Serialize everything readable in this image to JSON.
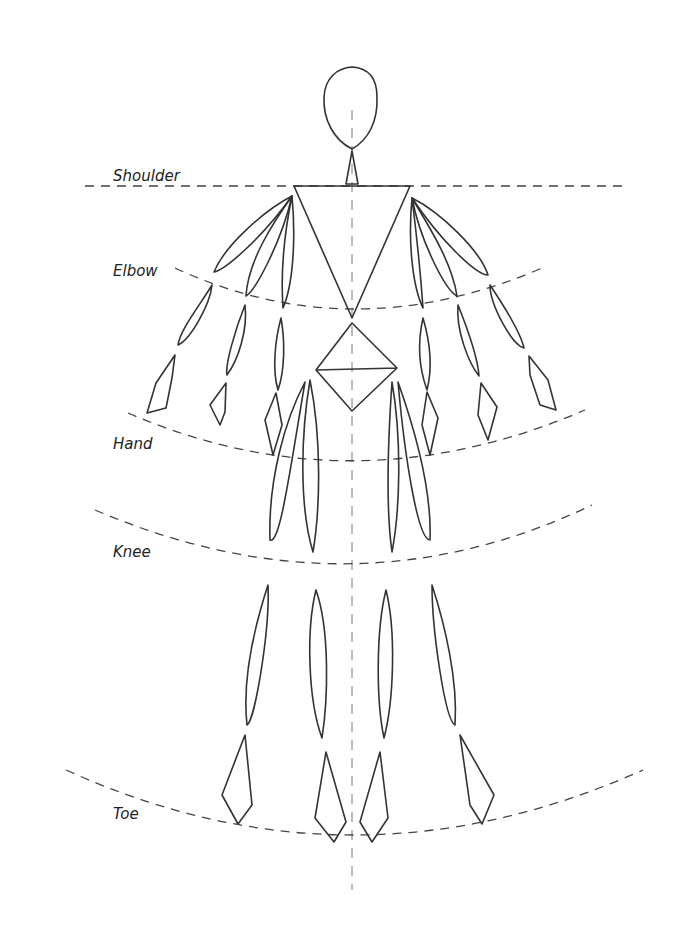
{
  "figure": {
    "type": "figure-proportion-sketch",
    "labels": {
      "shoulder": "Shoulder",
      "elbow": "Elbow",
      "hand": "Hand",
      "knee": "Knee",
      "toe": "Toe"
    },
    "colors": {
      "ink": "#333333",
      "guide": "#444444",
      "background": "#ffffff"
    }
  }
}
